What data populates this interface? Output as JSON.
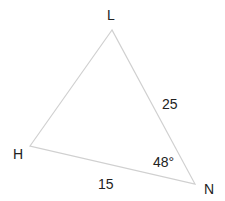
{
  "diagram": {
    "type": "triangle",
    "vertices": {
      "L": {
        "label": "L",
        "x": 112,
        "y": 30
      },
      "H": {
        "label": "H",
        "x": 30,
        "y": 146
      },
      "N": {
        "label": "N",
        "x": 195,
        "y": 184
      }
    },
    "sides": {
      "LN": {
        "label": "25"
      },
      "HN": {
        "label": "15"
      }
    },
    "angles": {
      "N": {
        "label": "48°"
      }
    },
    "line_color": "#d0d0d0"
  }
}
